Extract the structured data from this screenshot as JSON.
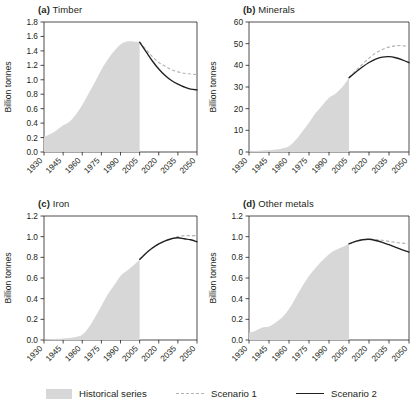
{
  "figure": {
    "name": "global-resource-extraction-scenarios",
    "ylabel": "Billion tonnes"
  },
  "legend": {
    "position": "bottom",
    "items": [
      {
        "label": "Historical series",
        "marker": "filled-area",
        "color": "#d7d7d7"
      },
      {
        "label": "Scenario 1",
        "marker": "dashed-line",
        "color": "#b3b3b3"
      },
      {
        "label": "Scenario 2",
        "marker": "solid-line",
        "color": "#231f20"
      }
    ]
  },
  "chart_data": [
    {
      "type": "area",
      "panel": "a",
      "tag": "(a)",
      "title": "Timber",
      "xlabel": "",
      "ylabel": "Billion tonnes",
      "xlim": [
        1930,
        2050
      ],
      "ylim": [
        0.0,
        1.8
      ],
      "xticks": [
        1930,
        1945,
        1960,
        1975,
        1990,
        2005,
        2020,
        2035,
        2050
      ],
      "yticks": [
        0.0,
        0.2,
        0.4,
        0.6,
        0.8,
        1.0,
        1.2,
        1.4,
        1.6,
        1.8
      ],
      "ytick_labels": [
        "0.0",
        "0.2",
        "0.4",
        "0.6",
        "0.8",
        "1.0",
        "1.2",
        "1.4",
        "1.6",
        "1.8"
      ],
      "grid": false,
      "series": [
        {
          "name": "Historical series",
          "style": "area",
          "x": [
            1930,
            1935,
            1940,
            1945,
            1950,
            1955,
            1960,
            1965,
            1970,
            1975,
            1980,
            1985,
            1990,
            1995,
            2000,
            2005
          ],
          "values": [
            0.21,
            0.25,
            0.3,
            0.37,
            0.42,
            0.52,
            0.65,
            0.81,
            0.97,
            1.14,
            1.28,
            1.4,
            1.49,
            1.53,
            1.53,
            1.52
          ]
        },
        {
          "name": "Scenario 1",
          "style": "dashed",
          "x": [
            2005,
            2010,
            2015,
            2020,
            2025,
            2030,
            2035,
            2040,
            2045,
            2050
          ],
          "values": [
            1.52,
            1.42,
            1.32,
            1.24,
            1.19,
            1.14,
            1.11,
            1.09,
            1.08,
            1.07
          ]
        },
        {
          "name": "Scenario 2",
          "style": "solid",
          "x": [
            2005,
            2010,
            2015,
            2020,
            2025,
            2030,
            2035,
            2040,
            2045,
            2050
          ],
          "values": [
            1.52,
            1.39,
            1.26,
            1.15,
            1.06,
            0.99,
            0.94,
            0.9,
            0.87,
            0.86
          ]
        }
      ]
    },
    {
      "type": "area",
      "panel": "b",
      "tag": "(b)",
      "title": "Minerals",
      "xlabel": "",
      "ylabel": "Billion tonnes",
      "xlim": [
        1930,
        2050
      ],
      "ylim": [
        0,
        60
      ],
      "xticks": [
        1930,
        1945,
        1960,
        1975,
        1990,
        2005,
        2020,
        2035,
        2050
      ],
      "yticks": [
        0,
        10,
        20,
        30,
        40,
        50,
        60
      ],
      "ytick_labels": [
        "0",
        "10",
        "20",
        "30",
        "40",
        "50",
        "60"
      ],
      "grid": false,
      "series": [
        {
          "name": "Historical series",
          "style": "area",
          "x": [
            1930,
            1935,
            1940,
            1945,
            1950,
            1955,
            1960,
            1965,
            1970,
            1975,
            1980,
            1985,
            1990,
            1995,
            2000,
            2005
          ],
          "values": [
            0.4,
            0.5,
            0.7,
            0.8,
            1.1,
            1.6,
            2.6,
            5.5,
            9.5,
            13.5,
            18.0,
            21.5,
            25.0,
            27.0,
            30.0,
            34.3
          ]
        },
        {
          "name": "Scenario 1",
          "style": "dashed",
          "x": [
            2005,
            2010,
            2015,
            2020,
            2025,
            2030,
            2035,
            2040,
            2045,
            2050
          ],
          "values": [
            34.3,
            37.5,
            40.5,
            43.3,
            45.6,
            47.3,
            48.4,
            49.0,
            49.1,
            48.5
          ]
        },
        {
          "name": "Scenario 2",
          "style": "solid",
          "x": [
            2005,
            2010,
            2015,
            2020,
            2025,
            2030,
            2035,
            2040,
            2045,
            2050
          ],
          "values": [
            34.3,
            36.8,
            39.2,
            41.3,
            42.9,
            43.8,
            44.0,
            43.5,
            42.5,
            41.2
          ]
        }
      ]
    },
    {
      "type": "area",
      "panel": "c",
      "tag": "(c)",
      "title": "Iron",
      "xlabel": "",
      "ylabel": "Billion tonnes",
      "xlim": [
        1930,
        2050
      ],
      "ylim": [
        0.0,
        1.2
      ],
      "xticks": [
        1930,
        1945,
        1960,
        1975,
        1990,
        2005,
        2020,
        2035,
        2050
      ],
      "yticks": [
        0.0,
        0.2,
        0.4,
        0.6,
        0.8,
        1.0,
        1.2
      ],
      "ytick_labels": [
        "0.0",
        "0.2",
        "0.4",
        "0.6",
        "0.8",
        "1.0",
        "1.2"
      ],
      "grid": false,
      "series": [
        {
          "name": "Historical series",
          "style": "area",
          "x": [
            1930,
            1935,
            1940,
            1945,
            1950,
            1955,
            1960,
            1965,
            1970,
            1975,
            1980,
            1985,
            1990,
            1995,
            2000,
            2005
          ],
          "values": [
            0.005,
            0.008,
            0.012,
            0.015,
            0.02,
            0.03,
            0.05,
            0.12,
            0.22,
            0.33,
            0.44,
            0.53,
            0.62,
            0.67,
            0.72,
            0.78
          ]
        },
        {
          "name": "Scenario 1",
          "style": "dashed",
          "x": [
            2005,
            2010,
            2015,
            2020,
            2025,
            2030,
            2035,
            2040,
            2045,
            2050
          ],
          "values": [
            0.78,
            0.84,
            0.89,
            0.93,
            0.96,
            0.98,
            1.0,
            1.01,
            1.01,
            1.01
          ]
        },
        {
          "name": "Scenario 2",
          "style": "solid",
          "x": [
            2005,
            2010,
            2015,
            2020,
            2025,
            2030,
            2035,
            2040,
            2045,
            2050
          ],
          "values": [
            0.78,
            0.84,
            0.89,
            0.93,
            0.96,
            0.98,
            0.99,
            0.98,
            0.97,
            0.95
          ]
        }
      ]
    },
    {
      "type": "area",
      "panel": "d",
      "tag": "(d)",
      "title": "Other metals",
      "xlabel": "",
      "ylabel": "Billion tonnes",
      "xlim": [
        1930,
        2050
      ],
      "ylim": [
        0.0,
        1.2
      ],
      "xticks": [
        1930,
        1945,
        1960,
        1975,
        1990,
        2005,
        2020,
        2035,
        2050
      ],
      "yticks": [
        0.0,
        0.2,
        0.4,
        0.6,
        0.8,
        1.0,
        1.2
      ],
      "ytick_labels": [
        "0.0",
        "0.2",
        "0.4",
        "0.6",
        "0.8",
        "1.0",
        "1.2"
      ],
      "grid": false,
      "series": [
        {
          "name": "Historical series",
          "style": "area",
          "x": [
            1930,
            1935,
            1940,
            1945,
            1950,
            1955,
            1960,
            1965,
            1970,
            1975,
            1980,
            1985,
            1990,
            1995,
            2000,
            2005
          ],
          "values": [
            0.07,
            0.09,
            0.12,
            0.13,
            0.17,
            0.22,
            0.3,
            0.41,
            0.52,
            0.62,
            0.7,
            0.77,
            0.83,
            0.87,
            0.9,
            0.93
          ]
        },
        {
          "name": "Scenario 1",
          "style": "dashed",
          "x": [
            2005,
            2010,
            2015,
            2020,
            2025,
            2030,
            2035,
            2040,
            2045,
            2050
          ],
          "values": [
            0.93,
            0.955,
            0.97,
            0.975,
            0.972,
            0.965,
            0.955,
            0.945,
            0.938,
            0.932
          ]
        },
        {
          "name": "Scenario 2",
          "style": "solid",
          "x": [
            2005,
            2010,
            2015,
            2020,
            2025,
            2030,
            2035,
            2040,
            2045,
            2050
          ],
          "values": [
            0.93,
            0.955,
            0.97,
            0.975,
            0.963,
            0.945,
            0.922,
            0.897,
            0.872,
            0.851
          ]
        }
      ]
    }
  ]
}
